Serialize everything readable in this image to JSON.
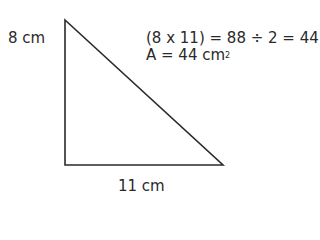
{
  "diagram": {
    "shape": "right-triangle",
    "height_label": "8 cm",
    "base_label": "11 cm",
    "calc_line1": "(8 x 11) = 88 ÷ 2 = 44",
    "calc_line2_prefix": "A = 44 cm",
    "calc_line2_sup": "2",
    "stroke_color": "#2a2a2a"
  }
}
